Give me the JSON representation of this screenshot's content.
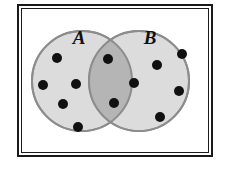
{
  "figure": {
    "background_color": "#FFFFFF"
  },
  "frame": {
    "name": "outer-frame",
    "outer_color": "#1A1A1A",
    "inner_color": "#1A1A1A",
    "fill_color": "#FFFFFF",
    "x": 17,
    "y": 4,
    "width": 196,
    "height": 153,
    "outer_stroke": 2,
    "gap": 2,
    "inner_stroke": 1
  },
  "sets": [
    {
      "id": "A",
      "label": "A",
      "label_x": 79,
      "label_y": 44,
      "cx": 82,
      "cy": 81,
      "r": 50,
      "fill_color": "#DCDCDC",
      "stroke_color": "#8C8C8C",
      "stroke_width": 2,
      "dot_count": 5
    },
    {
      "id": "B",
      "label": "B",
      "label_x": 150,
      "label_y": 44,
      "cx": 139,
      "cy": 81,
      "r": 50,
      "fill_color": "#DCDCDC",
      "stroke_color": "#8C8C8C",
      "stroke_width": 2,
      "dot_count": 4
    }
  ],
  "intersection": {
    "label": "A and B",
    "fill_color": "#B5B5B5",
    "dot_count": 3
  },
  "dots": {
    "color": "#111111",
    "radius": 5,
    "total": 12,
    "a_only": [
      {
        "x": 57,
        "y": 58
      },
      {
        "x": 43,
        "y": 85
      },
      {
        "x": 76,
        "y": 84
      },
      {
        "x": 63,
        "y": 104
      },
      {
        "x": 78,
        "y": 127
      }
    ],
    "intersection": [
      {
        "x": 108,
        "y": 59
      },
      {
        "x": 134,
        "y": 83
      },
      {
        "x": 114,
        "y": 103
      }
    ],
    "b_only": [
      {
        "x": 182,
        "y": 54
      },
      {
        "x": 157,
        "y": 65
      },
      {
        "x": 179,
        "y": 91
      },
      {
        "x": 160,
        "y": 117
      }
    ]
  }
}
